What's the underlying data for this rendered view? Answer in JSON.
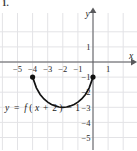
{
  "figure": {
    "problem_number": "1.",
    "width": 137,
    "height": 150,
    "background_color": "#ffffff",
    "grid_color": "#e3e3e6",
    "axis_color": "#59595c",
    "curve_color": "#111111"
  },
  "axes": {
    "x_label": "x",
    "y_label": "y",
    "x_ticks": [
      {
        "value": -5,
        "label": "−5"
      },
      {
        "value": -4,
        "label": "−4"
      },
      {
        "value": -3,
        "label": "−3"
      },
      {
        "value": -2,
        "label": "−2"
      },
      {
        "value": -1,
        "label": "−1"
      },
      {
        "value": 1,
        "label": "1"
      }
    ],
    "y_ticks": [
      {
        "value": 1,
        "label": "1"
      },
      {
        "value": -1,
        "label": "−1"
      },
      {
        "value": -2,
        "label": "−2"
      },
      {
        "value": -3,
        "label": "−3"
      },
      {
        "value": -4,
        "label": "−4"
      },
      {
        "value": -5,
        "label": "−5"
      }
    ],
    "xlim": [
      -6.2,
      2.0
    ],
    "ylim": [
      -5.8,
      2.0
    ],
    "grid": true,
    "grid_step": 1
  },
  "equation": {
    "full": "y = f(x + 2) − 1",
    "lhs": "y",
    "equals": "=",
    "func": "f",
    "open_paren": "(",
    "arg_var": "x",
    "plus": "+",
    "shift": "2",
    "close_paren": ")",
    "minus": "−",
    "vshift": "1"
  },
  "chart_data": {
    "type": "line",
    "title": "",
    "xlabel": "x",
    "ylabel": "y",
    "xlim": [
      -6.2,
      2.0
    ],
    "ylim": [
      -5.8,
      2.0
    ],
    "grid": true,
    "legend": "none",
    "series": [
      {
        "name": "y = f(x + 2) − 1",
        "shape": "semicircular downward arc",
        "domain": [
          -4,
          0
        ],
        "range": [
          -3,
          -1
        ],
        "vertex": {
          "x": -2,
          "y": -3
        },
        "x": [
          -4.0,
          -3.75,
          -3.5,
          -3.25,
          -3.0,
          -2.75,
          -2.5,
          -2.25,
          -2.0,
          -1.75,
          -1.5,
          -1.25,
          -1.0,
          -0.75,
          -0.5,
          -0.25,
          0.0
        ],
        "y": [
          -1.0,
          -1.71,
          -2.15,
          -2.45,
          -2.66,
          -2.81,
          -2.91,
          -2.98,
          -3.0,
          -2.98,
          -2.91,
          -2.81,
          -2.66,
          -2.45,
          -2.15,
          -1.71,
          -1.0
        ],
        "endpoints": [
          {
            "x": -4,
            "y": -1,
            "marker": "filled-circle"
          },
          {
            "x": 0,
            "y": -1,
            "marker": "filled-circle"
          }
        ]
      }
    ]
  }
}
